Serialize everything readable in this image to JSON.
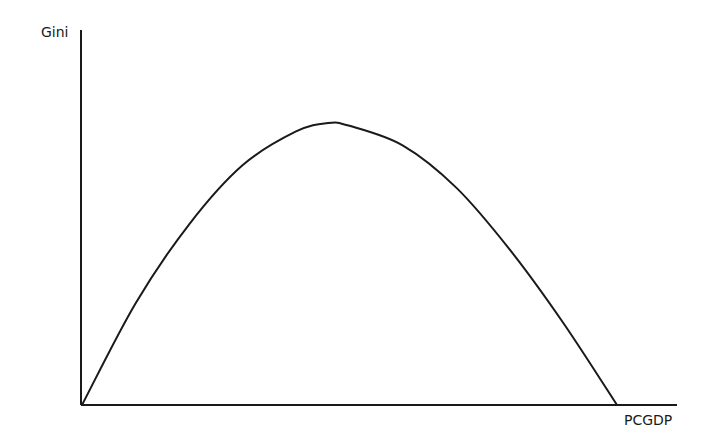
{
  "chart_data": {
    "type": "line",
    "title": "",
    "xlabel": "PCGDP",
    "ylabel": "Gini",
    "grid": false,
    "legend": null,
    "ticks": {
      "x": [],
      "y": []
    },
    "series": [
      {
        "name": "Kuznets curve",
        "color": "#1a1a1a",
        "x": [
          0.0,
          0.1,
          0.2,
          0.3,
          0.4,
          0.46,
          0.5,
          0.6,
          0.7,
          0.8,
          0.9,
          1.0
        ],
        "y": [
          0.0,
          0.36,
          0.64,
          0.85,
          0.97,
          1.0,
          0.99,
          0.92,
          0.77,
          0.55,
          0.29,
          0.0
        ]
      }
    ],
    "xlim": [
      0,
      1.11
    ],
    "ylim": [
      0,
      1.32
    ]
  },
  "colors": {
    "axis": "#1a1a1a",
    "curve": "#1a1a1a",
    "background": "#ffffff"
  }
}
